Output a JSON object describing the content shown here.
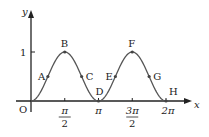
{
  "chart_data": {
    "type": "line",
    "title": "",
    "xlabel": "x",
    "ylabel": "y",
    "function": "y = sin^2(x)",
    "xlim": [
      0,
      6.2832
    ],
    "ylim": [
      0,
      1
    ],
    "grid": false,
    "x_ticks": [
      {
        "value": 1.5708,
        "label_num": "π",
        "label_den": "2"
      },
      {
        "value": 3.1416,
        "label": "π"
      },
      {
        "value": 4.7124,
        "label_num": "3π",
        "label_den": "2"
      },
      {
        "value": 6.2832,
        "label": "2π"
      }
    ],
    "y_ticks": [
      {
        "value": 1,
        "label": "1"
      }
    ],
    "origin_label": "O",
    "points": [
      {
        "name": "A",
        "x": 0.7854,
        "y": 0.5
      },
      {
        "name": "B",
        "x": 1.5708,
        "y": 1
      },
      {
        "name": "C",
        "x": 2.3562,
        "y": 0.5
      },
      {
        "name": "D",
        "x": 3.1416,
        "y": 0
      },
      {
        "name": "E",
        "x": 3.927,
        "y": 0.5
      },
      {
        "name": "F",
        "x": 4.7124,
        "y": 1
      },
      {
        "name": "G",
        "x": 5.4978,
        "y": 0.5
      },
      {
        "name": "H",
        "x": 6.2832,
        "y": 0
      }
    ]
  }
}
